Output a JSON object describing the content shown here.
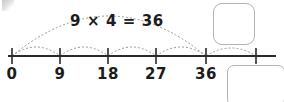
{
  "page": {
    "background_color": "#ffffff",
    "width": 284,
    "height": 102
  },
  "equation": {
    "text": "9×4=36",
    "display": "9 × 4 = 36",
    "left_factor": "9",
    "operator": "×",
    "right_factor": "4",
    "equals": "=",
    "product": "36",
    "x": 117,
    "y": 14,
    "color": "#1c1c1c"
  },
  "number_line": {
    "axis_color": "#2a2a2a",
    "axis_y": 56,
    "axis_x_start": 8,
    "axis_x_end": 276,
    "tick_color": "#2a2a2a",
    "tick_half_height": 8,
    "ticks": [
      {
        "label": "0",
        "value": 0,
        "x": 12,
        "has_label": true
      },
      {
        "label": "9",
        "value": 9,
        "x": 60,
        "has_label": true
      },
      {
        "label": "18",
        "value": 18,
        "x": 108,
        "has_label": true
      },
      {
        "label": "27",
        "value": 27,
        "x": 156,
        "has_label": true
      },
      {
        "label": "36",
        "value": 36,
        "x": 206,
        "has_label": true
      },
      {
        "label": "",
        "value": 45,
        "x": 256,
        "has_label": false
      }
    ],
    "label_y": 67
  },
  "arcs": {
    "color": "#9a9a9a",
    "dash": "2,2",
    "small_hops": [
      {
        "from_x": 12,
        "to_x": 60,
        "height": 9,
        "name": "hop-0-to-9"
      },
      {
        "from_x": 60,
        "to_x": 108,
        "height": 9,
        "name": "hop-9-to-18"
      },
      {
        "from_x": 108,
        "to_x": 156,
        "height": 9,
        "name": "hop-18-to-27"
      },
      {
        "from_x": 156,
        "to_x": 206,
        "height": 9,
        "name": "hop-27-to-36"
      },
      {
        "from_x": 206,
        "to_x": 256,
        "height": 9,
        "name": "hop-36-to-45"
      }
    ],
    "big_arc": {
      "from_x": 12,
      "to_x": 206,
      "peak_y": 16,
      "name": "total-span-arc"
    }
  },
  "answer_boxes": [
    {
      "name": "answer-box-top",
      "x": 213,
      "y": 3,
      "width": 42,
      "height": 42,
      "radius": 9,
      "value": ""
    },
    {
      "name": "answer-box-bottom",
      "x": 227,
      "y": 65,
      "width": 58,
      "height": 41,
      "radius": 7,
      "value": ""
    }
  ],
  "artifacts": {
    "corner_smudge": {
      "present": true,
      "x": 2,
      "y": 0,
      "width": 12,
      "height": 11
    }
  }
}
